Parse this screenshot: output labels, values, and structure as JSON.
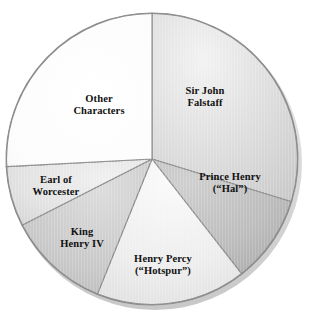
{
  "chart_data": {
    "type": "pie",
    "title": "",
    "subtitle": "",
    "xlabel": "",
    "ylabel": "",
    "legend_position": "none",
    "grid": false,
    "start_angle_deg": 0,
    "direction": "clockwise",
    "center": {
      "x": 152,
      "y": 159
    },
    "radius": 146,
    "categories": [
      "Sir John Falstaff",
      "Prince Henry (“Hal”)",
      "Henry Percy (“Hotspur”)",
      "King Henry IV",
      "Earl of Worcester",
      "Other Characters"
    ],
    "values": [
      29.7,
      9.7,
      16.7,
      11.4,
      6.7,
      25.8
    ],
    "units": "percent",
    "slices": [
      {
        "label": "Sir John\nFalstaff",
        "name": "Sir John Falstaff",
        "value": 29.7,
        "start_deg": 0,
        "end_deg": 107,
        "color": "#d9d9d9",
        "label_x": 205,
        "label_y": 97
      },
      {
        "label": "Prince Henry\n(“Hal”)",
        "name": "Prince Henry (“Hal”)",
        "value": 9.7,
        "start_deg": 107,
        "end_deg": 142,
        "color": "#bdbdbd",
        "label_x": 230,
        "label_y": 183
      },
      {
        "label": "Henry Percy\n(“Hotspur”)",
        "name": "Henry Percy (“Hotspur”)",
        "value": 16.7,
        "start_deg": 142,
        "end_deg": 202,
        "color": "#ececec",
        "label_x": 163,
        "label_y": 265
      },
      {
        "label": "King\nHenry IV",
        "name": "King Henry IV",
        "value": 11.4,
        "start_deg": 202,
        "end_deg": 243,
        "color": "#cacaca",
        "label_x": 82,
        "label_y": 238
      },
      {
        "label": "Earl of\nWorcester",
        "name": "Earl of Worcester",
        "value": 6.7,
        "start_deg": 243,
        "end_deg": 267,
        "color": "#e2e2e2",
        "label_x": 56,
        "label_y": 186
      },
      {
        "label": "Other\nCharacters",
        "name": "Other Characters",
        "value": 25.8,
        "start_deg": 267,
        "end_deg": 360,
        "color": "#fdfdfd",
        "label_x": 99,
        "label_y": 105
      }
    ],
    "colors": {
      "outline": "#8d8d8d",
      "label_text": "#111111",
      "background": "#ffffff"
    }
  }
}
